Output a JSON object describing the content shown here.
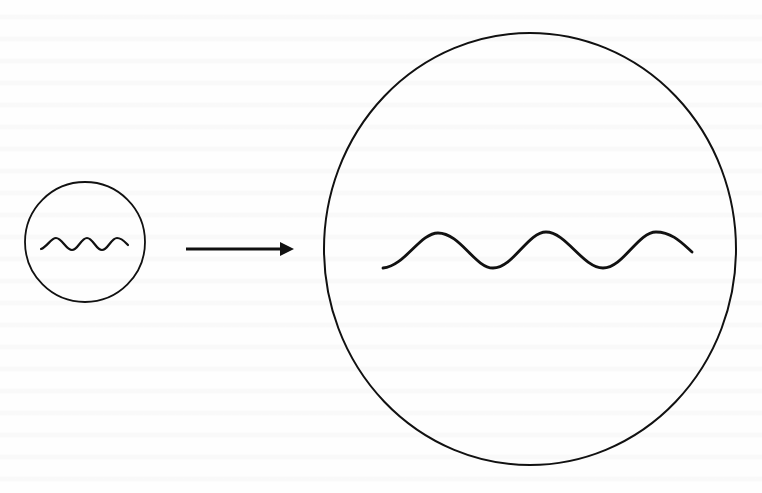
{
  "figure": {
    "stroke_color": "#111111",
    "background_color": "#fefefe",
    "small_circle": {
      "cx": 85,
      "cy": 242,
      "rx": 60,
      "ry": 60,
      "wave": {
        "path": "M 41 249 C 47 247, 51 238, 56 238 C 62 238, 66 250, 72 250 C 78 250, 81 238, 87 238 C 93 238, 96 250, 102 250 C 108 250, 111 238, 117 238 C 122 238, 125 242, 128 245",
        "stroke_width": 2.2
      }
    },
    "arrow": {
      "x1": 186,
      "y1": 249,
      "x2": 280,
      "y2": 249,
      "head": "280,242 294,249 280,256",
      "stroke_width": 3
    },
    "large_circle": {
      "cx": 530,
      "cy": 249,
      "rx": 206,
      "ry": 216,
      "wave": {
        "path": "M 383 268 C 405 266, 420 233, 438 233 C 460 233, 475 268, 493 268 C 513 268, 528 232, 546 232 C 566 232, 583 268, 603 268 C 623 268, 638 232, 656 232 C 672 232, 682 243, 692 252",
        "stroke_width": 2.8
      }
    }
  }
}
